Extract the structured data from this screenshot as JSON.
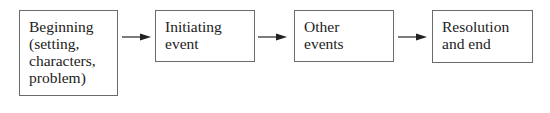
{
  "diagram": {
    "type": "flowchart",
    "direction": "left-to-right",
    "nodes": [
      {
        "id": "beginning",
        "lines": [
          "Beginning",
          "(setting,",
          "characters,",
          "problem)"
        ]
      },
      {
        "id": "initiating",
        "lines": [
          "Initiating",
          "event"
        ]
      },
      {
        "id": "other",
        "lines": [
          "Other",
          "events"
        ]
      },
      {
        "id": "resolution",
        "lines": [
          "Resolution",
          "and end"
        ]
      }
    ],
    "edges": [
      {
        "from": "beginning",
        "to": "initiating"
      },
      {
        "from": "initiating",
        "to": "other"
      },
      {
        "from": "other",
        "to": "resolution"
      }
    ],
    "colors": {
      "border": "#6b6b6b",
      "text": "#222222",
      "arrow": "#222222",
      "background": "#ffffff"
    }
  }
}
